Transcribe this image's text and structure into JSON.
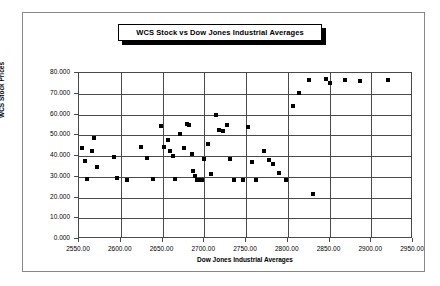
{
  "chart_data": {
    "type": "scatter",
    "title": "WCS Stock vs Dow Jones Industrial Averages",
    "xlabel": "Dow Jones Industrial Averages",
    "ylabel": "WCS Stock Prices",
    "xlim": [
      2550,
      2950
    ],
    "ylim": [
      0,
      80
    ],
    "xticks": [
      "2550.00",
      "2600.00",
      "2650.00",
      "2700.00",
      "2750.00",
      "2800.00",
      "2850.00",
      "2900.00",
      "2950.00"
    ],
    "yticks": [
      "0.000",
      "10.000",
      "20.000",
      "30.000",
      "40.000",
      "50.000",
      "60.000",
      "70.000",
      "80.000"
    ],
    "grid": true,
    "legend": false,
    "marker": "square",
    "marker_color": "#000000",
    "points": [
      {
        "x": 2553,
        "y": 44.0
      },
      {
        "x": 2557,
        "y": 37.5
      },
      {
        "x": 2560,
        "y": 28.8
      },
      {
        "x": 2565,
        "y": 42.5
      },
      {
        "x": 2568,
        "y": 48.5
      },
      {
        "x": 2572,
        "y": 34.5
      },
      {
        "x": 2592,
        "y": 39.5
      },
      {
        "x": 2596,
        "y": 29.5
      },
      {
        "x": 2608,
        "y": 28.5
      },
      {
        "x": 2624,
        "y": 44.5
      },
      {
        "x": 2631,
        "y": 38.8
      },
      {
        "x": 2639,
        "y": 29.0
      },
      {
        "x": 2648,
        "y": 54.5
      },
      {
        "x": 2652,
        "y": 44.5
      },
      {
        "x": 2656,
        "y": 47.5
      },
      {
        "x": 2659,
        "y": 42.5
      },
      {
        "x": 2662,
        "y": 39.8
      },
      {
        "x": 2665,
        "y": 28.8
      },
      {
        "x": 2671,
        "y": 50.5
      },
      {
        "x": 2676,
        "y": 44.0
      },
      {
        "x": 2679,
        "y": 55.5
      },
      {
        "x": 2682,
        "y": 55.0
      },
      {
        "x": 2685,
        "y": 41.0
      },
      {
        "x": 2687,
        "y": 33.0
      },
      {
        "x": 2689,
        "y": 30.5
      },
      {
        "x": 2691,
        "y": 28.5
      },
      {
        "x": 2694,
        "y": 28.2
      },
      {
        "x": 2697,
        "y": 28.4
      },
      {
        "x": 2700,
        "y": 38.5
      },
      {
        "x": 2704,
        "y": 46.0
      },
      {
        "x": 2708,
        "y": 31.5
      },
      {
        "x": 2714,
        "y": 60.0
      },
      {
        "x": 2718,
        "y": 52.5
      },
      {
        "x": 2722,
        "y": 52.0
      },
      {
        "x": 2727,
        "y": 55.0
      },
      {
        "x": 2731,
        "y": 38.5
      },
      {
        "x": 2736,
        "y": 28.2
      },
      {
        "x": 2746,
        "y": 28.2
      },
      {
        "x": 2752,
        "y": 54.0
      },
      {
        "x": 2757,
        "y": 37.3
      },
      {
        "x": 2762,
        "y": 28.5
      },
      {
        "x": 2772,
        "y": 42.5
      },
      {
        "x": 2778,
        "y": 38.0
      },
      {
        "x": 2782,
        "y": 36.0
      },
      {
        "x": 2790,
        "y": 32.0
      },
      {
        "x": 2798,
        "y": 28.3
      },
      {
        "x": 2806,
        "y": 64.0
      },
      {
        "x": 2814,
        "y": 70.5
      },
      {
        "x": 2826,
        "y": 76.5
      },
      {
        "x": 2830,
        "y": 21.5
      },
      {
        "x": 2846,
        "y": 77.0
      },
      {
        "x": 2851,
        "y": 75.2
      },
      {
        "x": 2868,
        "y": 76.5
      },
      {
        "x": 2886,
        "y": 76.0
      },
      {
        "x": 2920,
        "y": 76.5
      }
    ]
  }
}
